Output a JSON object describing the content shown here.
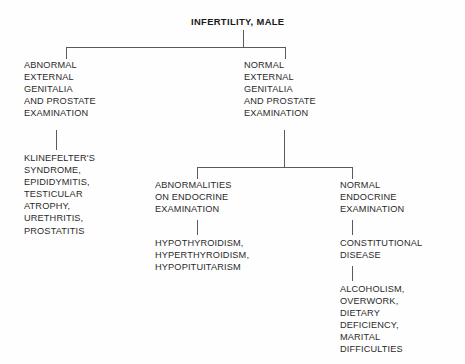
{
  "diagram": {
    "title": "INFERTILITY, MALE",
    "nodes": {
      "root": "INFERTILITY, MALE",
      "abnormal_exam": "ABNORMAL\nEXTERNAL\nGENITALIA\nAND PROSTATE\nEXAMINATION",
      "abnormal_causes": "KLINEFELTER'S\nSYNDROME,\nEPIDIDYMITIS,\nTESTICULAR\nATROPHY,\nURETHRITIS,\nPROSTATITIS",
      "normal_exam": "NORMAL\nEXTERNAL\nGENITALIA\nAND PROSTATE\nEXAMINATION",
      "abnormal_endocrine": "ABNORMALITIES\nON ENDOCRINE\nEXAMINATION",
      "abnormal_endocrine_causes": "HYPOTHYROIDISM,\nHYPERTHYROIDISM,\nHYPOPITUITARISM",
      "normal_endocrine": "NORMAL\nENDOCRINE\nEXAMINATION",
      "constitutional": "CONSTITUTIONAL\nDISEASE",
      "constitutional_causes": "ALCOHOLISM,\nOVERWORK,\nDIETARY\nDEFICIENCY,\nMARITAL\nDIFFICULTIES"
    },
    "colors": {
      "text": "#2b2b2b",
      "line": "#5a5a5a",
      "background": "#fefefe"
    }
  }
}
